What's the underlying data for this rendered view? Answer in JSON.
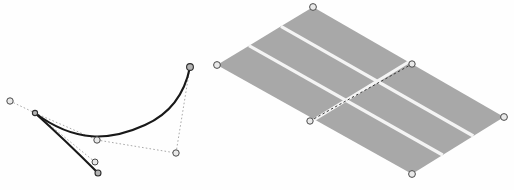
{
  "document": {
    "title": "Bezier curve and mesh grid illustration",
    "background_color": "#fefefe",
    "width": 514,
    "height": 190
  },
  "palette": {
    "curve_stroke": "#181818",
    "tangent_stroke": "#9a9a9a",
    "mesh_fill": "#a8a8a8",
    "mesh_gridline": "#f4f4f4",
    "mesh_diagonal": "#3a3a3a",
    "handle_stroke": "#4a4a4a",
    "handle_fill": "#e9e9e9"
  },
  "bezier_figure": {
    "name": "bezier-curve-editor",
    "segments": [
      {
        "name": "upper-segment",
        "path": "M 35 113 C 75 143 110 141 145 125 C 172 113 185 92 190 67"
      },
      {
        "name": "lower-segment",
        "path": "M 35 113 C 55 131 80 155 98 173"
      }
    ],
    "tangent_handles": [
      {
        "name": "tangent-left-outer",
        "path": "M 10 101 L 35 113"
      },
      {
        "name": "tangent-mid",
        "path": "M 35 113 L 97 140"
      },
      {
        "name": "tangent-lower-mid",
        "path": "M 97 140 L 176 153"
      },
      {
        "name": "tangent-right",
        "path": "M 176 153 L 190 67"
      },
      {
        "name": "tangent-short-lower",
        "path": "M 35 113 L 95 162"
      }
    ],
    "points": [
      {
        "name": "anchor-left-outer",
        "x": 10,
        "y": 101,
        "r": 3.2,
        "kind": "control"
      },
      {
        "name": "anchor-cusp",
        "x": 35,
        "y": 113,
        "r": 2.6,
        "kind": "anchor"
      },
      {
        "name": "control-mid-lower",
        "x": 97,
        "y": 140,
        "r": 3.2,
        "kind": "control"
      },
      {
        "name": "control-right-lower",
        "x": 176,
        "y": 153,
        "r": 3.2,
        "kind": "control"
      },
      {
        "name": "anchor-top-right",
        "x": 190,
        "y": 67,
        "r": 3.4,
        "kind": "anchor"
      },
      {
        "name": "control-bottom-upper",
        "x": 95,
        "y": 162,
        "r": 3.0,
        "kind": "control"
      },
      {
        "name": "anchor-bottom-end",
        "x": 98,
        "y": 173,
        "r": 3.0,
        "kind": "anchor"
      }
    ]
  },
  "mesh_figure": {
    "name": "mesh-grid-patch",
    "corners": {
      "top": {
        "x": 313,
        "y": 7
      },
      "left": {
        "x": 217,
        "y": 65
      },
      "bottom": {
        "x": 412,
        "y": 174
      },
      "right": {
        "x": 504,
        "y": 117
      }
    },
    "columns": 3,
    "rows": 2,
    "fill_color": "#a8a8a8",
    "gridline_color": "#f4f4f4",
    "diagonal": {
      "name": "mesh-diagonal-guide",
      "start": {
        "x": 310,
        "y": 121
      },
      "end": {
        "x": 412,
        "y": 64
      }
    },
    "handles": [
      {
        "name": "mesh-handle-top",
        "x": 313,
        "y": 7,
        "r": 3.4
      },
      {
        "name": "mesh-handle-left",
        "x": 217,
        "y": 65,
        "r": 3.4
      },
      {
        "name": "mesh-handle-bottom",
        "x": 412,
        "y": 174,
        "r": 3.4
      },
      {
        "name": "mesh-handle-right",
        "x": 504,
        "y": 117,
        "r": 3.4
      },
      {
        "name": "mesh-handle-diagonal-start",
        "x": 310,
        "y": 121,
        "r": 3.2
      },
      {
        "name": "mesh-handle-diagonal-end",
        "x": 412,
        "y": 64,
        "r": 3.2
      }
    ]
  }
}
